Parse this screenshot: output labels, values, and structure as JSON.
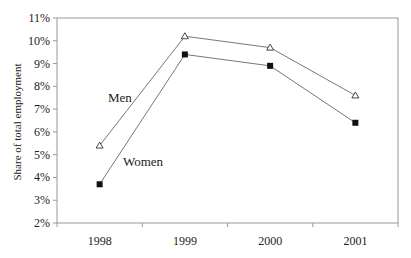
{
  "chart_data": {
    "type": "line",
    "title": "",
    "xlabel": "",
    "ylabel": "Share of total employment",
    "categories": [
      "1998",
      "1999",
      "2000",
      "2001"
    ],
    "series": [
      {
        "name": "Men",
        "marker": "open-triangle",
        "values": [
          5.4,
          10.2,
          9.7,
          7.6
        ]
      },
      {
        "name": "Women",
        "marker": "filled-square",
        "values": [
          3.7,
          9.4,
          8.9,
          6.4
        ]
      }
    ],
    "ylim": [
      2,
      11
    ],
    "yticks": [
      "2%",
      "3%",
      "4%",
      "5%",
      "6%",
      "7%",
      "8%",
      "9%",
      "10%",
      "11%"
    ],
    "grid": false,
    "legend": "inline labels"
  },
  "labels": {
    "men": "Men",
    "women": "Women",
    "ylabel": "Share of total employment"
  },
  "colors": {
    "line": "#777777",
    "axis": "#999999",
    "marker": "#111111"
  }
}
